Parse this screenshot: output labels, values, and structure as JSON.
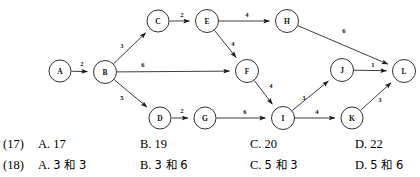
{
  "graph": {
    "type": "directed-weighted-graph",
    "nodes": [
      {
        "id": "A",
        "label": "A",
        "cx": 60,
        "cy": 71,
        "r": 11
      },
      {
        "id": "B",
        "label": "B",
        "cx": 105,
        "cy": 72,
        "r": 11.5
      },
      {
        "id": "C",
        "label": "C",
        "cx": 158,
        "cy": 21,
        "r": 11
      },
      {
        "id": "D",
        "label": "D",
        "cx": 160,
        "cy": 118,
        "r": 11
      },
      {
        "id": "E",
        "label": "E",
        "cx": 207,
        "cy": 21,
        "r": 11.5
      },
      {
        "id": "F",
        "label": "F",
        "cx": 247,
        "cy": 71,
        "r": 11.5
      },
      {
        "id": "G",
        "label": "G",
        "cx": 205,
        "cy": 118,
        "r": 11
      },
      {
        "id": "H",
        "label": "H",
        "cx": 287,
        "cy": 21,
        "r": 11.5
      },
      {
        "id": "I",
        "label": "I",
        "cx": 283,
        "cy": 118,
        "r": 11.5
      },
      {
        "id": "J",
        "label": "J",
        "cx": 342,
        "cy": 70,
        "r": 11.5
      },
      {
        "id": "K",
        "label": "K",
        "cx": 352,
        "cy": 118,
        "r": 11
      },
      {
        "id": "L",
        "label": "L",
        "cx": 404,
        "cy": 71,
        "r": 11.5
      }
    ],
    "edges": [
      {
        "from": "A",
        "to": "B",
        "weight": "2",
        "lx": 82,
        "ly": 63
      },
      {
        "from": "B",
        "to": "C",
        "weight": "3",
        "lx": 122,
        "ly": 45
      },
      {
        "from": "B",
        "to": "F",
        "weight": "6",
        "lx": 143,
        "ly": 64
      },
      {
        "from": "B",
        "to": "D",
        "weight": "5",
        "lx": 122,
        "ly": 97
      },
      {
        "from": "C",
        "to": "E",
        "weight": "2",
        "lx": 182,
        "ly": 14
      },
      {
        "from": "E",
        "to": "H",
        "weight": "4",
        "lx": 247,
        "ly": 14
      },
      {
        "from": "E",
        "to": "F",
        "weight": "4",
        "lx": 233,
        "ly": 43
      },
      {
        "from": "H",
        "to": "L",
        "weight": "6",
        "lx": 344,
        "ly": 30
      },
      {
        "from": "D",
        "to": "G",
        "weight": "2",
        "lx": 182,
        "ly": 110
      },
      {
        "from": "G",
        "to": "I",
        "weight": "6",
        "lx": 245,
        "ly": 111
      },
      {
        "from": "F",
        "to": "I",
        "weight": "4",
        "lx": 271,
        "ly": 85
      },
      {
        "from": "I",
        "to": "J",
        "weight": "3",
        "lx": 304,
        "ly": 97
      },
      {
        "from": "I",
        "to": "K",
        "weight": "4",
        "lx": 317,
        "ly": 111
      },
      {
        "from": "J",
        "to": "L",
        "weight": "1",
        "lx": 373,
        "ly": 64
      },
      {
        "from": "K",
        "to": "L",
        "weight": "3",
        "lx": 380,
        "ly": 99
      }
    ]
  },
  "answers": {
    "rows": [
      {
        "number": "(17)",
        "options": [
          {
            "letter": "A.",
            "text": "17"
          },
          {
            "letter": "B.",
            "text": "19"
          },
          {
            "letter": "C.",
            "text": "20"
          },
          {
            "letter": "D.",
            "text": "22"
          }
        ]
      },
      {
        "number": "(18)",
        "options": [
          {
            "letter": "A.",
            "text": "3 和 3"
          },
          {
            "letter": "B.",
            "text": "3 和 6"
          },
          {
            "letter": "C.",
            "text": "5 和 3"
          },
          {
            "letter": "D.",
            "text": "5 和 6"
          }
        ]
      }
    ]
  }
}
